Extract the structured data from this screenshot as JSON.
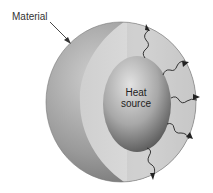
{
  "diagram": {
    "labels": {
      "material": "Material",
      "heat_line1": "Heat",
      "heat_line2": "source"
    },
    "colors": {
      "outer_shell": "#8c8c8c",
      "cut_face": "#d4d4d4",
      "heat_source": "#9a9a9a",
      "arrows": "#222222"
    },
    "heat_arrows_count": 5
  }
}
